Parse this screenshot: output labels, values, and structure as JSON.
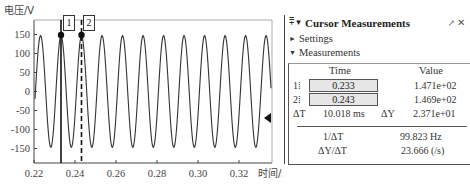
{
  "plot": {
    "y_axis_title": "电压/V",
    "x_axis_title": "时间/s",
    "y_ticks": [
      "150",
      "100",
      "50",
      "0",
      "-50",
      "-100",
      "-150"
    ],
    "x_ticks": [
      "0.22",
      "0.24",
      "0.26",
      "0.28",
      "0.30",
      "0.32"
    ],
    "cursor1_tag": "1",
    "cursor2_tag": "2",
    "line_color": "#333333"
  },
  "chart_data": {
    "type": "line",
    "title": "",
    "xlabel": "时间/s",
    "ylabel": "电压/V",
    "xlim": [
      0.22,
      0.335
    ],
    "ylim": [
      -185,
      185
    ],
    "x_ticks": [
      0.22,
      0.24,
      0.26,
      0.28,
      0.3,
      0.32
    ],
    "y_ticks": [
      150,
      100,
      50,
      0,
      -50,
      -100,
      -150
    ],
    "grid": false,
    "series": [
      {
        "name": "voltage",
        "description": "sinusoid, amplitude ~147 V, frequency ~100 Hz",
        "amplitude": 147,
        "frequency_hz": 100,
        "first_peak_x": 0.2232
      }
    ],
    "cursors": [
      {
        "id": 1,
        "x": 0.233,
        "y": 147.1,
        "style": "solid"
      },
      {
        "id": 2,
        "x": 0.243,
        "y": 146.9,
        "style": "dashed"
      }
    ]
  },
  "panel": {
    "title": "Cursor Measurements",
    "header_icons": "⩱ ▾",
    "undock_icon": "↗",
    "close_icon": "✕",
    "settings_label": "Settings",
    "measurements_label": "Measurements",
    "columns": {
      "time": "Time",
      "value": "Value"
    },
    "rows": [
      {
        "label": "1",
        "time": "0.233",
        "value": "1.471e+02"
      },
      {
        "label": "2",
        "time": "0.243",
        "value": "1.469e+02"
      }
    ],
    "delta_t_label": "ΔT",
    "delta_t_value": "10.018 ms",
    "delta_y_label": "ΔY",
    "delta_y_value": "2.371e+01",
    "inv_dt_label": "1/ΔT",
    "inv_dt_value": "99.823 Hz",
    "dy_dt_label": "ΔY/ΔT",
    "dy_dt_value": "23.666 (/s)"
  }
}
